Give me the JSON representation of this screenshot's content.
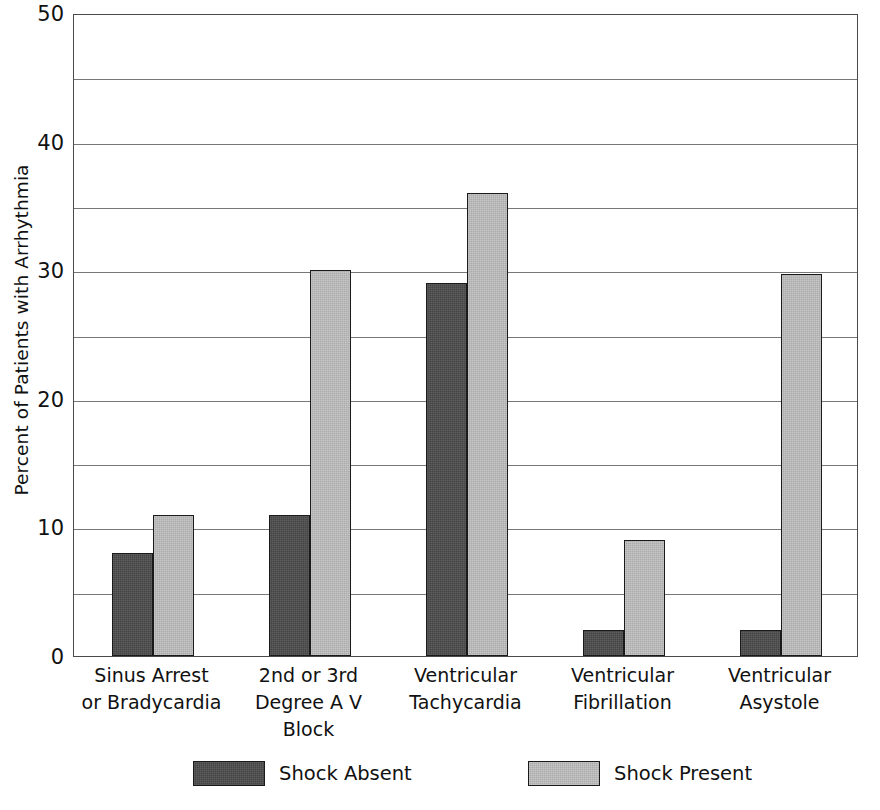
{
  "chart_data": {
    "type": "bar",
    "title": "",
    "xlabel": "",
    "ylabel": "Percent of Patients with Arrhythmia",
    "ylim": [
      0,
      50
    ],
    "y_ticks": [
      0,
      10,
      20,
      30,
      40,
      50
    ],
    "y_tick_labels": [
      "0",
      "10",
      "20",
      "30",
      "40",
      "50"
    ],
    "y_gridlines": [
      5,
      10,
      15,
      20,
      25,
      30,
      35,
      40,
      45
    ],
    "grid": true,
    "legend_position": "bottom",
    "categories": [
      "Sinus Arrest or Bradycardia",
      "2nd or 3rd Degree A V Block",
      "Ventricular Tachycardia",
      "Ventricular Fibrillation",
      "Ventricular Asystole"
    ],
    "category_lines": [
      [
        "Sinus Arrest",
        "or Bradycardia"
      ],
      [
        "2nd or 3rd",
        "Degree A V",
        "Block"
      ],
      [
        "Ventricular",
        "Tachycardia"
      ],
      [
        "Ventricular",
        "Fibrillation"
      ],
      [
        "Ventricular",
        "Asystole"
      ]
    ],
    "series": [
      {
        "name": "Shock Absent",
        "color": "#444444",
        "values": [
          8,
          11,
          29,
          2,
          2
        ]
      },
      {
        "name": "Shock Present",
        "color": "#ababab",
        "values": [
          11,
          30,
          36,
          9,
          29.7
        ]
      }
    ]
  },
  "legend": {
    "entries": [
      {
        "label": "Shock Absent",
        "swatch": "absent"
      },
      {
        "label": "Shock Present",
        "swatch": "present"
      }
    ]
  },
  "axis": {
    "y_title": "Percent of Patients with Arrhythmia"
  },
  "colors": {
    "shock_absent": "#444444",
    "shock_present": "#ababab",
    "axis_line": "#4a4a4a",
    "gridline": "#777777",
    "bar_border": "#1a1a1a",
    "background": "#ffffff"
  }
}
